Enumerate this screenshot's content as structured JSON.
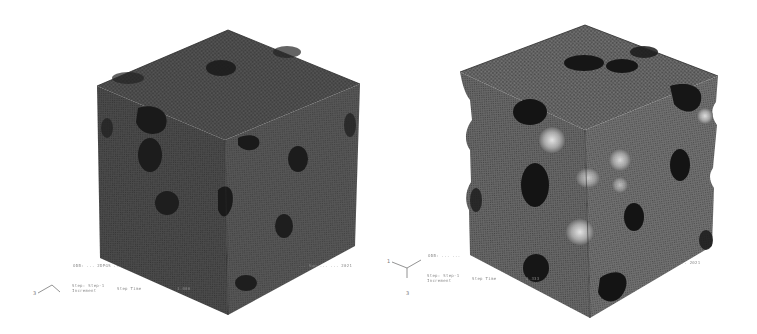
{
  "figure": {
    "colors": {
      "background": "#ffffff",
      "mesh_face_top": "#4a4a4a",
      "mesh_face_left": "#3a3a3a",
      "mesh_face_right": "#444444",
      "pore_dark": "#1a1a1a",
      "highlight_pore": "#c8c8c8",
      "label_text": "#8a8a8a"
    },
    "panels": [
      {
        "name": "undeformed-cube",
        "status_line_1_left": "ODB: ... 2DPGS ... ",
        "status_line_1_right": "... Sun ... ... 2021",
        "status_line_2_left": "Step: Step-1",
        "status_line_2_sub": "Increment",
        "status_line_2_mid": "Step Time",
        "status_line_2_right": "1.000",
        "triad_axes": [
          "3",
          "1",
          "2"
        ]
      },
      {
        "name": "deformed-cube",
        "status_line_1_left": "ODB: ... ... ",
        "status_line_1_right": "... ... 2021",
        "status_line_2_left": "Step: Step-1",
        "status_line_2_sub": "Increment",
        "status_line_2_mid": "Step Time",
        "status_line_2_right": "0.333",
        "triad_axes": [
          "1",
          "2",
          "3"
        ]
      }
    ]
  }
}
